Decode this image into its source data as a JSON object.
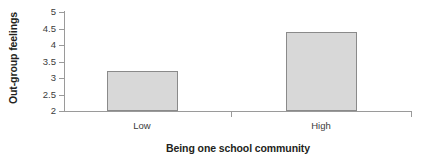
{
  "chart_data": {
    "type": "bar",
    "title": "",
    "categories": [
      "Low",
      "High"
    ],
    "values": [
      3.2,
      4.4
    ],
    "series": [
      {
        "name": "Out-group feelings",
        "values": [
          3.2,
          4.4
        ]
      }
    ],
    "xlabel": "Being one school community",
    "ylabel": "Out-group feelings",
    "ylim": [
      2,
      5
    ],
    "yticks": [
      2,
      2.5,
      3,
      3.5,
      4,
      4.5,
      5
    ],
    "ytick_labels": [
      "2",
      "2.5",
      "3",
      "3.5",
      "4",
      "4.5",
      "5"
    ],
    "grid": false,
    "legend": false,
    "legend_position": "none",
    "bar_fill_color": "#d8d8d8",
    "bar_border_color": "#8a8a8a",
    "axis_color": "#9a9a9a",
    "text_color": "#231f20",
    "background_color": "#ffffff"
  }
}
